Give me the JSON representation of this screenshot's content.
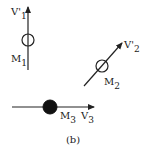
{
  "figure": {
    "caption": "(b)",
    "bodies": [
      {
        "id": "M1",
        "mass_label": "M",
        "mass_sub": "1",
        "velocity_label": "V'",
        "velocity_sub": "1",
        "direction": "up",
        "fill": "hollow"
      },
      {
        "id": "M2",
        "mass_label": "M",
        "mass_sub": "2",
        "velocity_label": "V'",
        "velocity_sub": "2",
        "direction": "up-right",
        "fill": "hollow"
      },
      {
        "id": "M3",
        "mass_label": "M",
        "mass_sub": "3",
        "velocity_label": "V",
        "velocity_sub": "3",
        "direction": "right",
        "fill": "solid"
      }
    ]
  },
  "colors": {
    "stroke": "#222222",
    "background": "#ffffff"
  }
}
